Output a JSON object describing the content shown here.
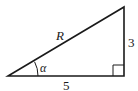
{
  "diagram": {
    "type": "right-triangle",
    "hypotenuse_label": "R",
    "vertical_side_label": "3",
    "horizontal_side_label": "5",
    "angle_label": "α",
    "colors": {
      "stroke": "#1a1a1a",
      "background": "#ffffff"
    }
  }
}
